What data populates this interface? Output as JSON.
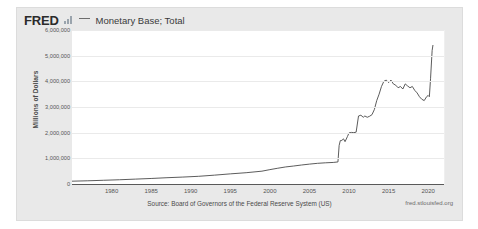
{
  "header": {
    "logo_text": "FRED",
    "logo_icon": "bar-chart-icon",
    "legend_line_icon": "line-dash-icon",
    "series_title": "Monetary Base; Total"
  },
  "footer": {
    "source": "Source: Board of Governors of the Federal Reserve System (US)",
    "url": "fred.stlouisfed.org"
  },
  "colors": {
    "card_bg": "#e9e9e9",
    "plot_bg": "#ffffff",
    "line": "#4a4a4a",
    "grid": "#eaeaea",
    "axis": "#595959",
    "tick_text": "#555555"
  },
  "chart_data": {
    "type": "line",
    "title": "Monetary Base; Total",
    "xlabel": "",
    "ylabel": "Millions of Dollars",
    "xlim": [
      1975,
      2022
    ],
    "ylim": [
      0,
      6000000
    ],
    "grid": true,
    "legend_position": "top",
    "xticks": [
      "1980",
      "1985",
      "1990",
      "1995",
      "2000",
      "2005",
      "2010",
      "2015",
      "2020"
    ],
    "xtick_values": [
      1980,
      1985,
      1990,
      1995,
      2000,
      2005,
      2010,
      2015,
      2020
    ],
    "yticks": [
      "0",
      "1,000,000",
      "2,000,000",
      "3,000,000",
      "4,000,000",
      "5,000,000",
      "6,000,000"
    ],
    "ytick_values": [
      0,
      1000000,
      2000000,
      3000000,
      4000000,
      5000000,
      6000000
    ],
    "series": [
      {
        "name": "Monetary Base; Total",
        "units": "Millions of Dollars",
        "x": [
          1975,
          1977,
          1979,
          1981,
          1983,
          1985,
          1987,
          1989,
          1991,
          1993,
          1995,
          1997,
          1999,
          2000,
          2001,
          2002,
          2003,
          2004,
          2005,
          2006,
          2007,
          2008.0,
          2008.6,
          2008.75,
          2008.9,
          2009.1,
          2009.3,
          2009.5,
          2009.8,
          2010.0,
          2010.3,
          2010.6,
          2010.9,
          2011.2,
          2011.5,
          2011.8,
          2012.0,
          2012.3,
          2012.6,
          2012.9,
          2013.2,
          2013.5,
          2013.8,
          2014.1,
          2014.4,
          2014.7,
          2015.0,
          2015.3,
          2015.6,
          2015.9,
          2016.2,
          2016.5,
          2016.8,
          2017.1,
          2017.4,
          2017.7,
          2018.0,
          2018.3,
          2018.6,
          2018.9,
          2019.2,
          2019.5,
          2019.8,
          2020.0,
          2020.15,
          2020.3,
          2020.5,
          2020.6
        ],
        "y": [
          110000,
          125000,
          145000,
          165000,
          190000,
          215000,
          245000,
          270000,
          300000,
          345000,
          395000,
          440000,
          500000,
          560000,
          615000,
          665000,
          700000,
          740000,
          775000,
          805000,
          825000,
          840000,
          860000,
          1500000,
          1690000,
          1700000,
          1760000,
          1650000,
          1850000,
          1990000,
          2010000,
          2000000,
          2020000,
          2650000,
          2680000,
          2600000,
          2650000,
          2600000,
          2640000,
          2700000,
          2900000,
          3250000,
          3500000,
          3800000,
          4000000,
          4050000,
          3950000,
          4050000,
          3900000,
          3850000,
          3750000,
          3800000,
          3700000,
          3900000,
          3820000,
          3750000,
          3800000,
          3650000,
          3550000,
          3400000,
          3300000,
          3250000,
          3400000,
          3450000,
          3400000,
          4100000,
          5200000,
          5400000
        ]
      }
    ]
  }
}
